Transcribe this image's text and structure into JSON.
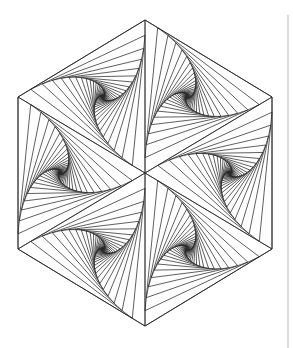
{
  "artwork": {
    "title": "Hexagonal spiral triangle line art",
    "stroke_color": "#2a2a2a",
    "background_color": "#ffffff",
    "hexagon": {
      "center": [
        145,
        173
      ],
      "vertices": [
        [
          145,
          20
        ],
        [
          272,
          97
        ],
        [
          272,
          249
        ],
        [
          145,
          326
        ],
        [
          18,
          249
        ],
        [
          18,
          97
        ]
      ]
    },
    "spiral": {
      "step_fraction": 0.1,
      "iterations": 30
    }
  },
  "side_rule": {
    "color": "#dcdcdc"
  }
}
